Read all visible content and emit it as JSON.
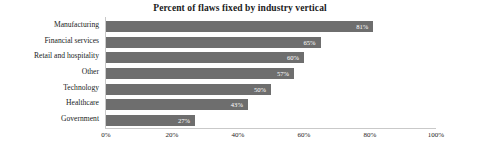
{
  "chart_data": {
    "type": "bar",
    "orientation": "horizontal",
    "title": "Percent of flaws fixed by industry vertical",
    "xlabel": "",
    "ylabel": "",
    "xlim": [
      0,
      100
    ],
    "grid": false,
    "legend": null,
    "bar_color": "#6e6e6e",
    "value_label_color": "#ffffff",
    "axis_color": "#c9c9c9",
    "categories": [
      "Manufacturing",
      "Financial services",
      "Retail and hospitality",
      "Other",
      "Technology",
      "Healthcare",
      "Government"
    ],
    "values": [
      81,
      65,
      60,
      57,
      50,
      43,
      27
    ],
    "value_labels": [
      "81%",
      "65%",
      "60%",
      "57%",
      "50%",
      "43%",
      "27%"
    ],
    "xticks": [
      0,
      20,
      40,
      60,
      80,
      100
    ],
    "xtick_labels": [
      "0%",
      "20%",
      "40%",
      "60%",
      "80%",
      "100%"
    ]
  }
}
